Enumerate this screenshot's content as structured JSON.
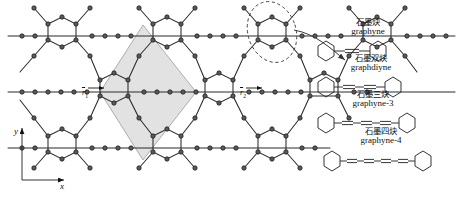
{
  "figure": {
    "background": "#ffffff",
    "atom_fill": "#555555",
    "atom_stroke": "#1a1a1a",
    "bond_color": "#2a2a2a",
    "unitcell_fill": "#d9d9d9",
    "unitcell_stroke": "#8a8a8a",
    "callout_stroke": "#4a4a4a"
  },
  "axes": {
    "x_label": "x",
    "y_label": "y",
    "origin": {
      "x": 22,
      "y": 180
    },
    "x_tip": {
      "x": 64,
      "y": 180
    },
    "y_tip": {
      "x": 22,
      "y": 128
    }
  },
  "lattice": {
    "name": "graphyne-2d-lattice",
    "description": "gamma-graphyne: benzene rings joined by two-carbon acetylenic linkers",
    "vectors": [
      {
        "id": "r1",
        "label": "r",
        "subscript": "1"
      },
      {
        "id": "r2",
        "label": "r",
        "subscript": "2"
      }
    ],
    "unit_cell": "rhombus"
  },
  "callout": {
    "name": "dashed-ellipse-callout",
    "target": "hexagonal ring in lattice"
  },
  "structures": [
    {
      "id": "graphyne",
      "cn": "石墨炔",
      "en": "graphyne",
      "triple_bonds": 1
    },
    {
      "id": "graphdiyne",
      "cn": "石墨双炔",
      "en": "graphdiyne",
      "triple_bonds": 2
    },
    {
      "id": "graphyne-3",
      "cn": "石墨三炔",
      "en": "graphyne-3",
      "triple_bonds": 3
    },
    {
      "id": "graphyne-4",
      "cn": "石墨四炔",
      "en": "graphyne-4",
      "triple_bonds": 4
    }
  ]
}
